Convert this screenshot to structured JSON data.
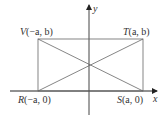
{
  "diagram": {
    "axes": {
      "x_label": "x",
      "y_label": "y"
    },
    "points": {
      "V": {
        "letter": "V",
        "coords": "(−a, b)"
      },
      "T": {
        "letter": "T",
        "coords": "(a, b)"
      },
      "R": {
        "letter": "R",
        "coords": "(−a, 0)"
      },
      "S": {
        "letter": "S",
        "coords": "(a, 0)"
      }
    },
    "colors": {
      "lines": "#555555",
      "axes": "#222222",
      "text": "#333333"
    }
  }
}
